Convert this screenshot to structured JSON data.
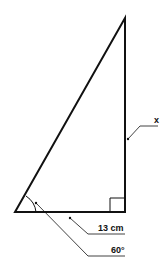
{
  "diagram": {
    "type": "right-triangle",
    "labels": {
      "unknown_side": "x",
      "base": "13 cm",
      "angle": "60°"
    },
    "colors": {
      "stroke": "#111111",
      "background": "#ffffff"
    }
  }
}
